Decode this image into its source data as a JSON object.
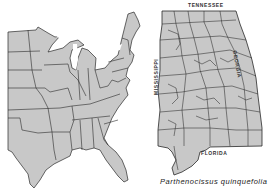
{
  "figure": {
    "type": "species-distribution-map",
    "species_caption": "Parthenocissus quinquefolia",
    "colors": {
      "fill": "#c8c8c8",
      "border": "#2a2a2a",
      "background": "#ffffff",
      "label": "#333333"
    }
  },
  "us_map": {
    "description": "Eastern United States, states filled gray indicating range"
  },
  "alabama_map": {
    "description": "Alabama counties, nearly all filled gray indicating presence",
    "border_labels": {
      "north": "TENNESSEE",
      "east": "GEORGIA",
      "west": "MISSISSIPPI",
      "south": "FLORIDA"
    }
  }
}
